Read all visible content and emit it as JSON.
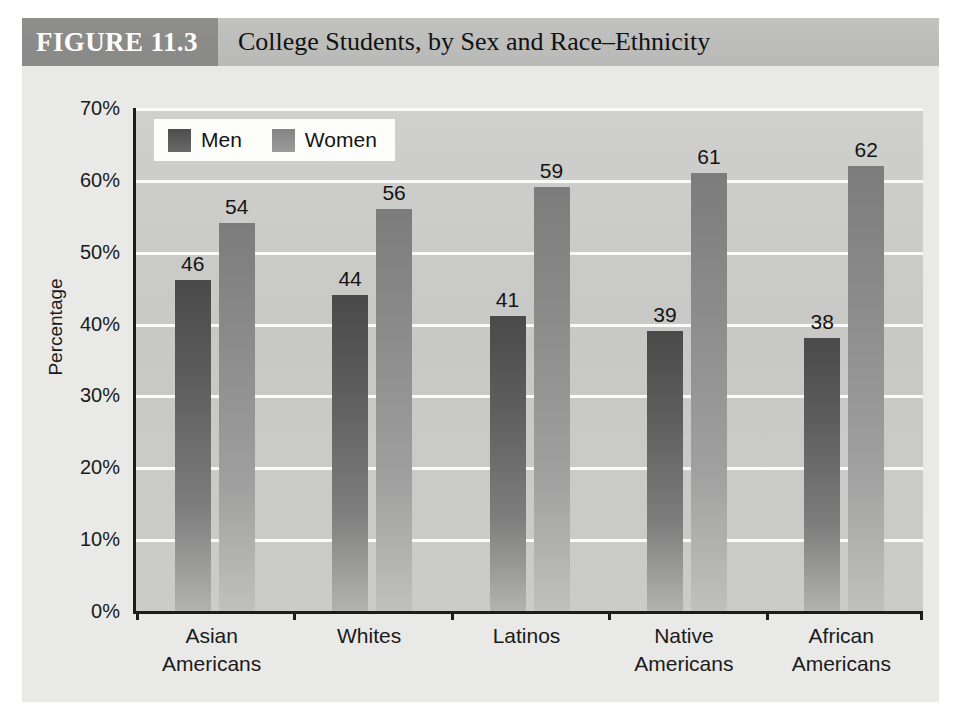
{
  "figure": {
    "number_label": "FIGURE 11.3",
    "title": "College Students, by Sex and Race–Ethnicity"
  },
  "colors": {
    "men_bar": "#5d5d5d",
    "women_bar": "#8c8c8c",
    "plot_background": "#c8c8c6",
    "gridline": "#fbfbfa",
    "axis": "#1c1c1c",
    "title_band_dark": "#8a8a88",
    "title_band_light": "#bcbcba",
    "page_background": "#e9e9e7"
  },
  "legend": {
    "position": "top-left-inside-plot",
    "items": [
      {
        "label": "Men",
        "swatch": "men"
      },
      {
        "label": "Women",
        "swatch": "women"
      }
    ]
  },
  "chart_data": {
    "type": "bar",
    "title": "College Students, by Sex and Race–Ethnicity",
    "xlabel": "",
    "ylabel": "Percentage",
    "ylim": [
      0,
      70
    ],
    "ytick_step": 10,
    "ytick_labels": [
      "70%",
      "60%",
      "50%",
      "40%",
      "30%",
      "20%",
      "10%",
      "0%"
    ],
    "ytick_values": [
      70,
      60,
      50,
      40,
      30,
      20,
      10,
      0
    ],
    "grid": true,
    "grid_axis": "y",
    "legend_position": "upper left",
    "categories": [
      "Asian\nAmericans",
      "Whites",
      "Latinos",
      "Native\nAmericans",
      "African\nAmericans"
    ],
    "category_lines": [
      [
        "Asian",
        "Americans"
      ],
      [
        "Whites",
        ""
      ],
      [
        "Latinos",
        ""
      ],
      [
        "Native",
        "Americans"
      ],
      [
        "African",
        "Americans"
      ]
    ],
    "series": [
      {
        "name": "Men",
        "values": [
          46,
          44,
          41,
          39,
          38
        ]
      },
      {
        "name": "Women",
        "values": [
          54,
          56,
          59,
          61,
          62
        ]
      }
    ],
    "value_labels": [
      "46",
      "54",
      "44",
      "56",
      "41",
      "59",
      "39",
      "61",
      "38",
      "62"
    ]
  }
}
